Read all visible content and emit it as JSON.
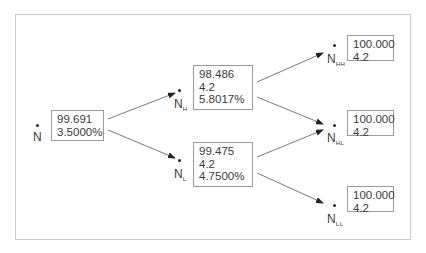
{
  "diagram": {
    "type": "binomial-tree",
    "nodes": [
      {
        "id": "N",
        "label": "N",
        "sub": "",
        "values": [
          "99.691",
          "3.5000%"
        ]
      },
      {
        "id": "NH",
        "label": "N",
        "sub": "H",
        "values": [
          "98.486",
          "4.2",
          "5.8017%"
        ]
      },
      {
        "id": "NL",
        "label": "N",
        "sub": "L",
        "values": [
          "99.475",
          "4.2",
          "4.7500%"
        ]
      },
      {
        "id": "NHH",
        "label": "N",
        "sub": "HH",
        "values": [
          "100.000",
          "4.2"
        ]
      },
      {
        "id": "NHL",
        "label": "N",
        "sub": "HL",
        "values": [
          "100.000",
          "4.2"
        ]
      },
      {
        "id": "NLL",
        "label": "N",
        "sub": "LL",
        "values": [
          "100.000",
          "4.2"
        ]
      }
    ],
    "edges": [
      {
        "from": "N",
        "to": "NH"
      },
      {
        "from": "N",
        "to": "NL"
      },
      {
        "from": "NH",
        "to": "NHH"
      },
      {
        "from": "NH",
        "to": "NHL"
      },
      {
        "from": "NL",
        "to": "NHL"
      },
      {
        "from": "NL",
        "to": "NLL"
      }
    ]
  }
}
